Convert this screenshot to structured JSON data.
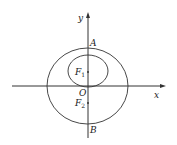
{
  "diagram": {
    "type": "coordinate-geometry",
    "axes": {
      "x_label": "x",
      "y_label": "y",
      "origin_label": "O"
    },
    "points": [
      {
        "id": "A",
        "label": "A"
      },
      {
        "id": "B",
        "label": "B"
      },
      {
        "id": "F1",
        "label": "F",
        "sub": "1"
      },
      {
        "id": "F2",
        "label": "F",
        "sub": "2"
      }
    ],
    "shapes": [
      {
        "id": "large-circle",
        "kind": "circle"
      },
      {
        "id": "small-circle",
        "kind": "circle"
      }
    ],
    "colors": {
      "stroke": "#333333",
      "background": "#ffffff"
    }
  }
}
